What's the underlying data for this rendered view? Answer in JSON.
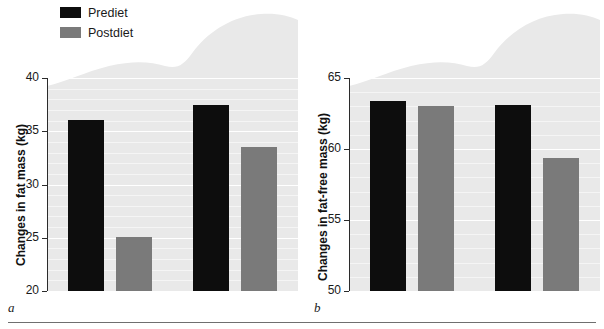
{
  "legend": {
    "items": [
      {
        "label": "Prediet",
        "color": "#0d0d0d",
        "key": "prediet"
      },
      {
        "label": "Postdiet",
        "color": "#7a7a7a",
        "key": "postdiet"
      }
    ]
  },
  "panels": [
    {
      "letter": "a",
      "ylabel": "Changes in fat mass (kg)",
      "yticks": [
        "20",
        "25",
        "30",
        "35",
        "40"
      ],
      "categories": [
        "Exercise",
        "Nonexercise"
      ]
    },
    {
      "letter": "b",
      "ylabel": "Changes in fat-free mass (kg)",
      "yticks": [
        "50",
        "55",
        "60",
        "65"
      ],
      "categories": [
        "Exercise",
        "Nonexercise"
      ]
    }
  ],
  "chart_data": [
    {
      "type": "bar",
      "panel": "a",
      "title": "",
      "xlabel": "",
      "ylabel": "Changes in fat mass (kg)",
      "categories": [
        "Exercise",
        "Nonexercise"
      ],
      "series": [
        {
          "name": "Prediet",
          "color": "#0d0d0d",
          "values": [
            36.1,
            37.5
          ]
        },
        {
          "name": "Postdiet",
          "color": "#7a7a7a",
          "values": [
            25.1,
            33.5
          ]
        }
      ],
      "ylim": [
        20,
        40
      ],
      "ytick_step": 5,
      "minor_tick_step": 1,
      "grid": true,
      "legend_position": "top-left"
    },
    {
      "type": "bar",
      "panel": "b",
      "title": "",
      "xlabel": "",
      "ylabel": "Changes in fat-free mass (kg)",
      "categories": [
        "Exercise",
        "Nonexercise"
      ],
      "series": [
        {
          "name": "Prediet",
          "color": "#0d0d0d",
          "values": [
            63.4,
            63.1
          ]
        },
        {
          "name": "Postdiet",
          "color": "#7a7a7a",
          "values": [
            63.0,
            59.4
          ]
        }
      ],
      "ylim": [
        50,
        65
      ],
      "ytick_step": 5,
      "minor_tick_step": 1,
      "grid": true,
      "legend_position": "none"
    }
  ]
}
